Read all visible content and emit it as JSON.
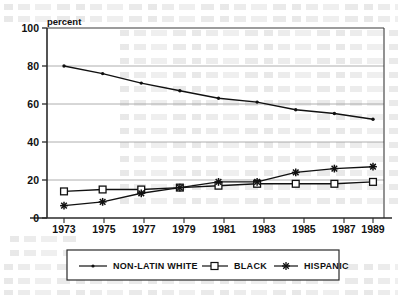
{
  "figure": {
    "y_axis_caption": "percent"
  },
  "chart_data": {
    "type": "line",
    "title": "",
    "subtitle": "",
    "xlabel": "",
    "ylabel": "percent",
    "categories": [
      "1973",
      "1975",
      "1977",
      "1979",
      "1981",
      "1983",
      "1985",
      "1987",
      "1989"
    ],
    "x": [
      1973,
      1975,
      1977,
      1979,
      1981,
      1983,
      1985,
      1987,
      1989
    ],
    "xlim": [
      1972,
      1990
    ],
    "ylim": [
      0,
      100
    ],
    "yticks": [
      "0",
      "20",
      "40",
      "60",
      "80",
      "100"
    ],
    "ytick_values": [
      0,
      20,
      40,
      60,
      80,
      100
    ],
    "grid": "horizontal",
    "legend_position": "below-plot",
    "series": [
      {
        "name": "NON-LATIN WHITE",
        "marker": "dot",
        "values": [
          80,
          76,
          71,
          67,
          63,
          61,
          57,
          55,
          52
        ]
      },
      {
        "name": "BLACK",
        "marker": "square",
        "values": [
          14,
          15,
          15,
          16,
          17,
          18,
          18,
          18,
          19
        ]
      },
      {
        "name": "HISPANIC",
        "marker": "asterisk",
        "values": [
          6.5,
          8.5,
          13,
          16,
          19,
          19,
          24,
          26,
          27
        ]
      }
    ]
  },
  "legend": {
    "items": [
      {
        "label": "NON-LATIN WHITE",
        "marker": "dot"
      },
      {
        "label": "BLACK",
        "marker": "square"
      },
      {
        "label": "HISPANIC",
        "marker": "asterisk"
      }
    ]
  },
  "colors": {
    "ink": "#111111",
    "grid": "#9a9a9a",
    "frame": "#3a3a3a",
    "paper": "#ffffff"
  }
}
